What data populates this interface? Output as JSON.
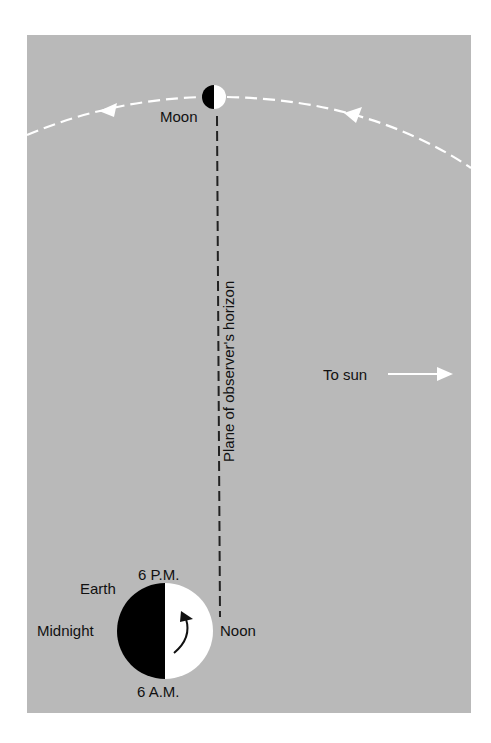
{
  "diagram": {
    "colors": {
      "background": "#b9b9b9",
      "dark": "#000000",
      "light": "#ffffff",
      "text": "#111111"
    },
    "labels": {
      "moon": "Moon",
      "horizon": "Plane of observer's horizon",
      "to_sun": "To sun",
      "earth": "Earth",
      "six_pm": "6 P.M.",
      "midnight": "Midnight",
      "noon": "Noon",
      "six_am": "6 A.M."
    },
    "icons": {
      "moon": "half-lit-moon-icon",
      "earth": "half-lit-earth-icon",
      "rotation": "curved-arrow-icon",
      "sun_direction": "right-arrow-icon",
      "orbit_direction": "left-arrow-icon"
    }
  }
}
